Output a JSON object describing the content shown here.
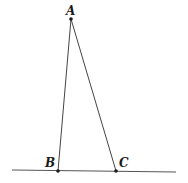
{
  "diagram": {
    "type": "geometry-triangle",
    "points": {
      "A": {
        "label": "A",
        "x": 71,
        "y": 19
      },
      "B": {
        "label": "B",
        "x": 58,
        "y": 171
      },
      "C": {
        "label": "C",
        "x": 116,
        "y": 171
      }
    },
    "baseline": {
      "x1": 12,
      "y1": 170,
      "x2": 176,
      "y2": 172
    },
    "segments": [
      [
        "A",
        "B"
      ],
      [
        "A",
        "C"
      ]
    ],
    "colors": {
      "stroke": "#333333",
      "point": "#1a1a1a"
    }
  }
}
